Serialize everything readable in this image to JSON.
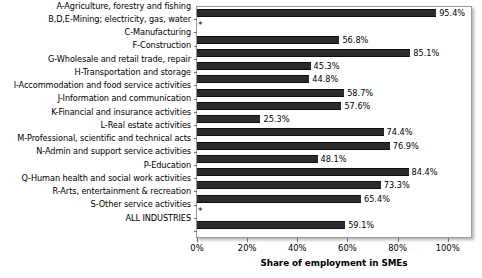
{
  "chart_data": {
    "type": "bar",
    "orientation": "horizontal",
    "title": "",
    "xlabel": "Share of employment in SMEs",
    "ylabel": "",
    "xlim": [
      0,
      109.3
    ],
    "xticks": [
      "0%",
      "20%",
      "40%",
      "60%",
      "80%",
      "100%"
    ],
    "xtick_values": [
      0,
      20,
      40,
      60,
      80,
      100
    ],
    "grid": false,
    "legend": null,
    "suppressed_marker": "*",
    "categories": [
      "A-Agriculture, forestry and fishing",
      "B,D,E-Mining; electricity, gas, water",
      "C-Manufacturing",
      "F-Construction",
      "G-Wholesale and retail trade, repair",
      "H-Transportation and storage",
      "I-Accommodation and food service activities",
      "J-Information and communication",
      "K-Financial and insurance activities",
      "L-Real estate activities",
      "M-Professional, scientific and technical acts",
      "N-Admin and support service activities",
      "P-Education",
      "Q-Human health and social work activities",
      "R-Arts, entertainment & recreation",
      "S-Other service activities",
      "ALL INDUSTRIES"
    ],
    "values": [
      95.4,
      null,
      56.8,
      85.1,
      45.3,
      44.8,
      58.7,
      57.6,
      25.3,
      74.4,
      76.9,
      48.1,
      84.4,
      73.3,
      65.4,
      null,
      59.1
    ],
    "labels": [
      "95.4%",
      "*",
      "56.8%",
      "85.1%",
      "45.3%",
      "44.8%",
      "58.7%",
      "57.6%",
      "25.3%",
      "74.4%",
      "76.9%",
      "48.1%",
      "84.4%",
      "73.3%",
      "65.4%",
      "*",
      "59.1%"
    ],
    "bar_color": "#2b2b2b"
  }
}
